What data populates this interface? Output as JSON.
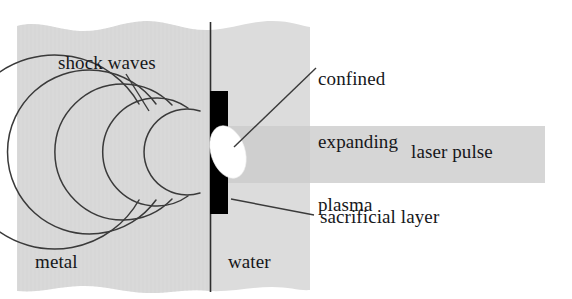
{
  "figure": {
    "type": "schematic-diagram",
    "background_color": "#ffffff"
  },
  "labels": {
    "shock_waves": "shock waves",
    "confined_expanding_plasma": "confined\nexpanding\nplasma",
    "confined_expanding_plasma_lines": [
      "confined",
      "expanding",
      "plasma"
    ],
    "laser_pulse": "laser pulse",
    "sacrificial_layer": "sacrificial layer",
    "metal": "metal",
    "water": "water"
  },
  "colors": {
    "metal_fill": "#d9d9d9",
    "water_fill": "#dcdcdc",
    "laser_beam_fill": "#d6d6d6",
    "sacrificial_layer_fill": "#000000",
    "plasma_fill": "#ffffff",
    "line_stroke": "#3a3a3a",
    "text": "#16171a",
    "page_background": "#ffffff"
  },
  "elements": {
    "metal_block": {
      "name": "metal",
      "left": 17,
      "right": 210,
      "top_wavy": true,
      "bottom_wavy": true
    },
    "water_block": {
      "name": "water",
      "left": 210,
      "right": 310,
      "top_wavy": true,
      "bottom_wavy": true
    },
    "interface_line": {
      "name": "metal-water-interface",
      "x": 210,
      "top": 22,
      "bottom": 292
    },
    "sacrificial_layer_bar": {
      "x": 210,
      "y": 91,
      "width": 18,
      "height": 123
    },
    "plasma_ellipse": {
      "cx": 228,
      "cy": 152,
      "rx": 17,
      "ry": 27,
      "rotation_deg": -18
    },
    "laser_beam": {
      "left": 228,
      "right": 545,
      "top": 126,
      "bottom": 183
    },
    "shock_wave_arcs": {
      "count": 5,
      "center_x": 212,
      "center_y": 152,
      "radii": [
        35,
        50,
        65,
        80,
        95
      ]
    },
    "leader_lines": [
      {
        "name": "shock-waves-leader",
        "x1": 126,
        "y1": 74,
        "x2": 149,
        "y2": 111
      },
      {
        "name": "plasma-leader",
        "x1": 316,
        "y1": 68,
        "x2": 234,
        "y2": 147
      },
      {
        "name": "sacrificial-layer-leader",
        "x1": 231,
        "y1": 199,
        "x2": 314,
        "y2": 215
      }
    ]
  }
}
